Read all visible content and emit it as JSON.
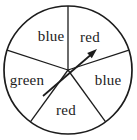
{
  "figure": {
    "type": "spinner-wheel",
    "background_color": "#ffffff",
    "stroke_color": "#1c1c1c",
    "text_color": "#1c1c1c",
    "sector_count": 5,
    "sectors": [
      {
        "label": "blue",
        "position": "top-left"
      },
      {
        "label": "red",
        "position": "top-right"
      },
      {
        "label": "blue",
        "position": "right"
      },
      {
        "label": "red",
        "position": "bottom"
      },
      {
        "label": "green",
        "position": "left"
      }
    ],
    "pointer": {
      "shape": "arrow-through-center",
      "direction": "up-right",
      "pointing_at_sector": "red"
    }
  }
}
